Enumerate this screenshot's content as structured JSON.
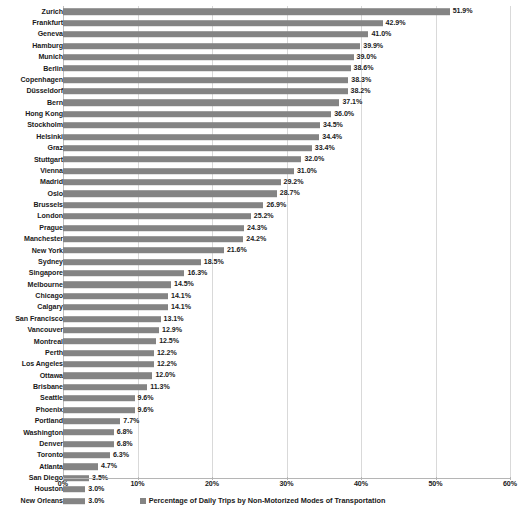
{
  "chart_data": {
    "type": "bar",
    "orientation": "horizontal",
    "title": "",
    "xlabel": "",
    "ylabel": "",
    "xlim": [
      0,
      60
    ],
    "xtick_values": [
      0,
      10,
      20,
      30,
      40,
      50,
      60
    ],
    "xtick_labels": [
      "0%",
      "10%",
      "20%",
      "30%",
      "40%",
      "50%",
      "60%"
    ],
    "grid": true,
    "legend_position": "bottom",
    "series_name": "Percentage of Daily Trips by Non-Motorized Modes of Transportation",
    "bar_color": "#848484",
    "value_suffix": "%",
    "categories": [
      "Zurich",
      "Frankfurt",
      "Geneva",
      "Hamburg",
      "Munich",
      "Berlin",
      "Copenhagen",
      "Düsseldorf",
      "Bern",
      "Hong Kong",
      "Stockholm",
      "Helsinki",
      "Graz",
      "Stuttgart",
      "Vienna",
      "Madrid",
      "Oslo",
      "Brussels",
      "London",
      "Prague",
      "Manchester",
      "New York",
      "Sydney",
      "Singapore",
      "Melbourne",
      "Chicago",
      "Calgary",
      "San Francisco",
      "Vancouver",
      "Montreal",
      "Perth",
      "Los Angeles",
      "Ottawa",
      "Brisbane",
      "Seattle",
      "Phoenix",
      "Portland",
      "Washington",
      "Denver",
      "Toronto",
      "Atlanta",
      "San Diego",
      "Houston",
      "New Orleans"
    ],
    "values": [
      51.9,
      42.9,
      41.0,
      39.9,
      39.0,
      38.6,
      38.3,
      38.2,
      37.1,
      36.0,
      34.5,
      34.4,
      33.4,
      32.0,
      31.0,
      29.2,
      28.7,
      26.9,
      25.2,
      24.3,
      24.2,
      21.6,
      18.5,
      16.3,
      14.5,
      14.1,
      14.1,
      13.1,
      12.9,
      12.5,
      12.2,
      12.2,
      12.0,
      11.3,
      9.6,
      9.6,
      7.7,
      6.8,
      6.8,
      6.3,
      4.7,
      3.5,
      3.0,
      3.0
    ],
    "value_labels": [
      "51.9%",
      "42.9%",
      "41.0%",
      "39.9%",
      "39.0%",
      "38.6%",
      "38.3%",
      "38.2%",
      "37.1%",
      "36.0%",
      "34.5%",
      "34.4%",
      "33.4%",
      "32.0%",
      "31.0%",
      "29.2%",
      "28.7%",
      "26.9%",
      "25.2%",
      "24.3%",
      "24.2%",
      "21.6%",
      "18.5%",
      "16.3%",
      "14.5%",
      "14.1%",
      "14.1%",
      "13.1%",
      "12.9%",
      "12.5%",
      "12.2%",
      "12.2%",
      "12.0%",
      "11.3%",
      "9.6%",
      "9.6%",
      "7.7%",
      "6.8%",
      "6.8%",
      "6.3%",
      "4.7%",
      "3.5%",
      "3.0%",
      "3.0%"
    ]
  },
  "legend": {
    "label": "Percentage of Daily Trips by Non-Motorized Modes of Transportation"
  }
}
